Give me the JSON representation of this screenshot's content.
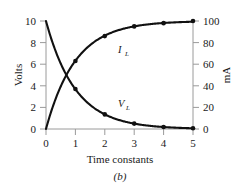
{
  "figure": {
    "caption": "(b)",
    "caption_name": "figure-caption"
  },
  "chart_data": {
    "type": "line",
    "title": "",
    "subtitle": "",
    "xlabel": "Time constants",
    "ylabel": "Volts",
    "y2label": "mA",
    "xlim": [
      0,
      5
    ],
    "ylim": [
      0,
      10
    ],
    "y2lim": [
      0,
      100
    ],
    "grid": false,
    "legend_position": "inline-annotation",
    "xticks": [
      "0",
      "1",
      "2",
      "3",
      "4",
      "5"
    ],
    "xtick_values": [
      0,
      1,
      2,
      3,
      4,
      5
    ],
    "yticks": [
      "0",
      "2",
      "4",
      "6",
      "8",
      "10"
    ],
    "ytick_values": [
      0,
      2,
      4,
      6,
      8,
      10
    ],
    "y2ticks": [
      "0",
      "20",
      "40",
      "60",
      "80",
      "100"
    ],
    "y2tick_values": [
      0,
      20,
      40,
      60,
      80,
      100
    ],
    "x": [
      0,
      1,
      2,
      3,
      4,
      5
    ],
    "series": [
      {
        "name": "I_L",
        "label_main": "I",
        "label_sub": "L",
        "axis": "right",
        "unit": "mA",
        "values": [
          0,
          63,
          86,
          95,
          98,
          100
        ],
        "marker_x": [
          1,
          2,
          3,
          4,
          5
        ],
        "marker_values": [
          63,
          86,
          95,
          98,
          100
        ],
        "color": "#111111",
        "description": "Inductor current exponential rise"
      },
      {
        "name": "V_L",
        "label_main": "V",
        "label_sub": "L",
        "axis": "left",
        "unit": "Volts",
        "values": [
          10,
          3.7,
          1.35,
          0.5,
          0.18,
          0.07
        ],
        "marker_x": [
          1,
          2,
          3,
          4,
          5
        ],
        "marker_values": [
          3.7,
          1.35,
          0.5,
          0.18,
          0.07
        ],
        "color": "#111111",
        "description": "Inductor voltage exponential decay"
      }
    ],
    "annotations": [
      {
        "text": "I",
        "sub": "L",
        "x": 2.55,
        "y_frac": 0.74,
        "name": "series-label-il"
      },
      {
        "text": "V",
        "sub": "L",
        "x": 2.55,
        "y_frac": 0.22,
        "name": "series-label-vl"
      }
    ]
  }
}
